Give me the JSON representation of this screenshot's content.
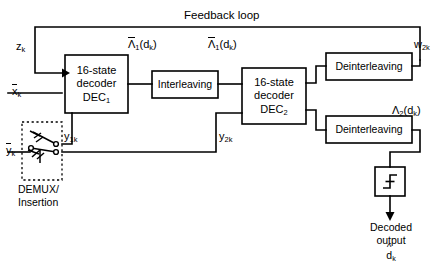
{
  "diagram": {
    "title": "Feedback loop",
    "blocks": {
      "dec1": {
        "line1": "16-state",
        "line2": "decoder",
        "line3": "DEC",
        "line3_sub": "1"
      },
      "dec2": {
        "line1": "16-state",
        "line2": "decoder",
        "line3": "DEC",
        "line3_sub": "2"
      },
      "interleaving": {
        "label": "Interleaving"
      },
      "deinterleaving_top": {
        "label": "Deinterleaving"
      },
      "deinterleaving_bottom": {
        "label": "Deinterleaving"
      },
      "threshold": {
        "label": "threshold-decision-icon"
      }
    },
    "signals": {
      "z_k": {
        "base": "z",
        "sub": "k"
      },
      "x_k": {
        "base": "x",
        "sub": "k",
        "overbar": true
      },
      "y_1k": {
        "base": "y",
        "sub": "1k"
      },
      "y_k": {
        "base": "y",
        "sub": "k",
        "overbar": true
      },
      "y_2k": {
        "base": "y",
        "sub": "2k"
      },
      "w_2k": {
        "base": "w",
        "sub": "2k"
      },
      "lambda1": {
        "base": "Λ",
        "sub": "1",
        "arg": "(d",
        "arg_sub": "k",
        "arg_close": ")",
        "overbar": true
      },
      "lambda1_tilde": {
        "base": "Λ",
        "sub": "1",
        "arg": "(d",
        "arg_sub": "k",
        "arg_close": ")",
        "overbar": true
      },
      "lambda2": {
        "base": "Λ",
        "sub": "2",
        "arg": "(d",
        "arg_sub": "k",
        "arg_close": ")"
      }
    },
    "annotations": {
      "demux_line1": "DEMUX/",
      "demux_line2": "Insertion",
      "decoded_line1": "Decoded",
      "decoded_line2": "output",
      "decoded_symbol": "d",
      "decoded_symbol_sub": "k"
    },
    "colors": {
      "stroke": "#000000",
      "background": "#ffffff",
      "text": "#000000"
    }
  }
}
